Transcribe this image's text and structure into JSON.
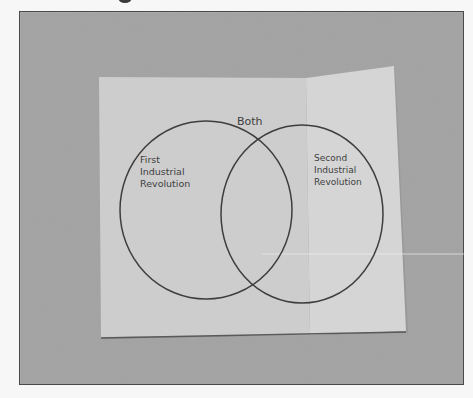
{
  "photo": {
    "description": "Photograph of a folded sheet of paper with a hand-drawn Venn diagram",
    "colors": {
      "page_background": "#f7f7f7",
      "frame_border": "#4a4a4a",
      "backdrop": "#a9a9a9",
      "paper_left_panel": "#cfcfcf",
      "paper_right_panel": "#d6d6d6",
      "ink": "#3e3e3e"
    }
  },
  "venn": {
    "overlap_label": "Both",
    "left_circle": {
      "label_lines": [
        "First",
        "Industrial",
        "Revolution"
      ]
    },
    "right_circle": {
      "label_lines": [
        "Second",
        "Industrial",
        "Revolution"
      ]
    }
  }
}
